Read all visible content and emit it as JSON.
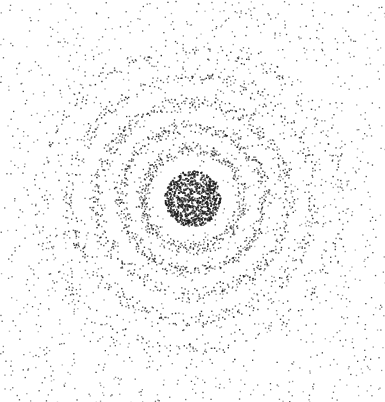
{
  "canvas": {
    "width": 385,
    "height": 402,
    "background": "#ffffff",
    "dot_color": "#1a1a1a"
  },
  "pattern": {
    "center": [
      192,
      198
    ],
    "seed": 7,
    "background_dots": 1500,
    "core": {
      "radius": 28,
      "dots": 900
    },
    "rings": [
      {
        "radius": 50,
        "width": 8,
        "dots": 420
      },
      {
        "radius": 72,
        "width": 8,
        "dots": 480
      },
      {
        "radius": 96,
        "width": 9,
        "dots": 520
      },
      {
        "radius": 122,
        "width": 10,
        "dots": 460
      },
      {
        "radius": 150,
        "width": 12,
        "dots": 300
      }
    ]
  }
}
